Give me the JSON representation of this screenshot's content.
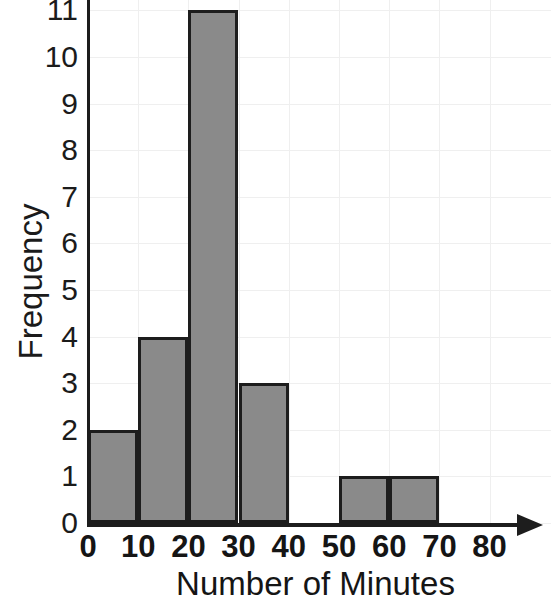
{
  "chart_data": {
    "type": "bar",
    "title": "",
    "subtitle": "",
    "xlabel": "Number of Minutes",
    "ylabel": "Frequency",
    "categories": [
      "0-10",
      "10-20",
      "20-30",
      "30-40",
      "40-50",
      "50-60",
      "60-70",
      "70-80"
    ],
    "bin_edges": [
      0,
      10,
      20,
      30,
      40,
      50,
      60,
      70,
      80
    ],
    "values": [
      2,
      4,
      11,
      3,
      0,
      1,
      1,
      0
    ],
    "xlim": [
      0,
      80
    ],
    "ylim": [
      0,
      11
    ],
    "x_ticks": [
      "0",
      "10",
      "20",
      "30",
      "40",
      "50",
      "60",
      "70",
      "80"
    ],
    "x_tick_values": [
      0,
      10,
      20,
      30,
      40,
      50,
      60,
      70,
      80
    ],
    "y_ticks": [
      "0",
      "1",
      "2",
      "3",
      "4",
      "5",
      "6",
      "7",
      "8",
      "9",
      "10",
      "11"
    ],
    "y_tick_values": [
      0,
      1,
      2,
      3,
      4,
      5,
      6,
      7,
      8,
      9,
      10,
      11
    ],
    "grid": true,
    "legend": "none",
    "bar_fill_color": "#8a8a8a",
    "bar_edge_color": "#1d1d1d",
    "axis_color": "#1d1d1d",
    "grid_color": "#efefef",
    "background_color": "#ffffff"
  },
  "axes": {
    "y_title": "Frequency",
    "x_title": "Number of Minutes"
  }
}
